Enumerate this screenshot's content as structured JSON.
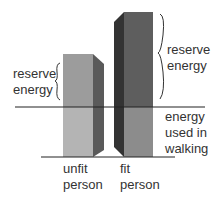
{
  "diagram": {
    "labels": {
      "reserve_left": [
        "reserve",
        "energy"
      ],
      "reserve_right": [
        "reserve",
        "energy"
      ],
      "walking": [
        "energy",
        "used in",
        "walking"
      ],
      "unfit": [
        "unfit",
        "person"
      ],
      "fit": [
        "fit",
        "person"
      ]
    },
    "colors": {
      "unfit_front_upper": "#9c9c9c",
      "unfit_front_lower": "#b4b4b4",
      "unfit_side": "#5a5a5a",
      "fit_front_upper": "#5e5e5e",
      "fit_front_lower": "#8c8c8c",
      "fit_side": "#333333",
      "line": "#222222"
    }
  }
}
